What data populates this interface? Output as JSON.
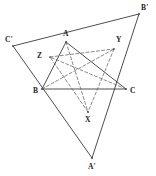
{
  "figure": {
    "canvas": {
      "width": 156,
      "height": 176,
      "background": "#ffffff"
    },
    "style": {
      "solid_stroke": "#3a3a3a",
      "dashed_stroke": "#6b6b6b",
      "solid_width": 0.9,
      "dashed_width": 0.8,
      "dash_pattern": "3,2.2",
      "label_color": "#242424"
    },
    "points": {
      "A": {
        "label": "A",
        "x": 66,
        "y": 42,
        "label_x": 63,
        "label_y": 30
      },
      "B": {
        "label": "B",
        "x": 42,
        "y": 89,
        "label_x": 33,
        "label_y": 87
      },
      "C": {
        "label": "C",
        "x": 126,
        "y": 89,
        "label_x": 130,
        "label_y": 87
      },
      "Ap": {
        "label": "A'",
        "x": 92,
        "y": 158,
        "label_x": 88,
        "label_y": 163
      },
      "Bp": {
        "label": "B'",
        "x": 139,
        "y": 14,
        "label_x": 141,
        "label_y": 4
      },
      "Cp": {
        "label": "C'",
        "x": 13,
        "y": 46,
        "label_x": 5,
        "label_y": 36
      },
      "X": {
        "label": "X",
        "x": 88,
        "y": 112,
        "label_x": 85,
        "label_y": 116
      },
      "Y": {
        "label": "Y",
        "x": 114,
        "y": 49,
        "label_x": 116,
        "label_y": 36
      },
      "Z": {
        "label": "Z",
        "x": 50,
        "y": 57,
        "label_x": 37,
        "label_y": 52
      }
    },
    "solid_edges": [
      {
        "name": "edge-A-B",
        "from": "A",
        "to": "B"
      },
      {
        "name": "edge-B-C",
        "from": "B",
        "to": "C"
      },
      {
        "name": "edge-C-A",
        "from": "C",
        "to": "A"
      },
      {
        "name": "edge-Ap-Bp",
        "from": "Ap",
        "to": "Bp"
      },
      {
        "name": "edge-Bp-Cp",
        "from": "Bp",
        "to": "Cp"
      },
      {
        "name": "edge-Cp-Ap",
        "from": "Cp",
        "to": "Ap"
      }
    ],
    "dashed_edges": [
      {
        "name": "dashed-edge-Z-Y",
        "from": "Z",
        "to": "Y"
      },
      {
        "name": "dashed-edge-Y-X",
        "from": "Y",
        "to": "X"
      },
      {
        "name": "dashed-edge-X-Z",
        "from": "X",
        "to": "Z"
      },
      {
        "name": "dashed-cevian-A-X",
        "from": "A",
        "to": "X"
      },
      {
        "name": "dashed-cevian-B-Y",
        "from": "B",
        "to": "Y"
      },
      {
        "name": "dashed-cevian-C-Z",
        "from": "C",
        "to": "Z"
      }
    ],
    "labels": [
      "A",
      "B",
      "C",
      "A'",
      "B'",
      "C'",
      "X",
      "Y",
      "Z"
    ]
  }
}
